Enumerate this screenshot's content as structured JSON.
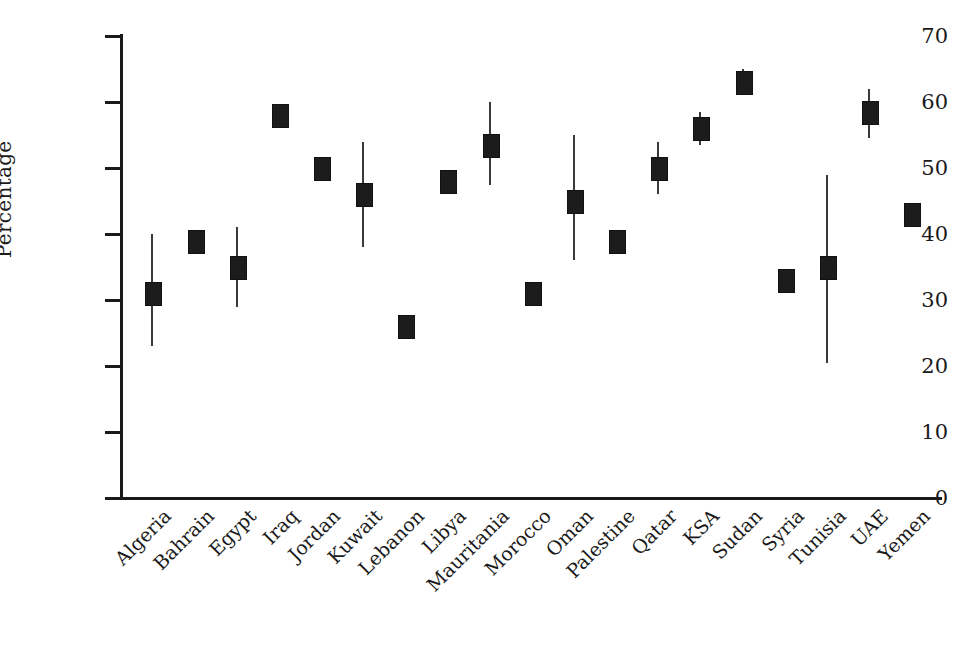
{
  "chart_data": {
    "type": "scatter",
    "title": "",
    "subtitle": "",
    "xlabel": "",
    "ylabel": "Percentage",
    "ylim": [
      0,
      70
    ],
    "yticks": [
      0,
      10,
      20,
      30,
      40,
      50,
      60,
      70
    ],
    "ytick_labels": [
      "0",
      "10",
      "20",
      "30",
      "40",
      "50",
      "60",
      "70"
    ],
    "grid": false,
    "legend": null,
    "marker_style": "filled-rectangle-with-vertical-error-bar",
    "categories": [
      "Algeria",
      "Bahrain",
      "Egypt",
      "Iraq",
      "Jordan",
      "Kuwait",
      "Lebanon",
      "Libya",
      "Mauritania",
      "Morocco",
      "Oman",
      "Palestine",
      "Qatar",
      "KSA",
      "Sudan",
      "Syria",
      "Tunisia",
      "UAE",
      "Yemen"
    ],
    "values": [
      31,
      39,
      35,
      58,
      50,
      46,
      26,
      48,
      53.5,
      31,
      45,
      39,
      50,
      56,
      63,
      33,
      35,
      58.5,
      43
    ],
    "ci_low": [
      23,
      37.5,
      29,
      56.5,
      48.5,
      38,
      25,
      46.5,
      47.5,
      29.5,
      36,
      37.5,
      46,
      53.5,
      61.5,
      32,
      20.5,
      54.5,
      41
    ],
    "ci_high": [
      40,
      40.5,
      41,
      59.5,
      51.5,
      54,
      27,
      49.5,
      60,
      32.5,
      55,
      40.5,
      54,
      58.5,
      65,
      34,
      49,
      62,
      44.5
    ],
    "points": [
      {
        "category": "Algeria",
        "value": 31,
        "ci_low": 23,
        "ci_high": 40
      },
      {
        "category": "Bahrain",
        "value": 39,
        "ci_low": 37.5,
        "ci_high": 40.5
      },
      {
        "category": "Egypt",
        "value": 35,
        "ci_low": 29,
        "ci_high": 41
      },
      {
        "category": "Iraq",
        "value": 58,
        "ci_low": 56.5,
        "ci_high": 59.5
      },
      {
        "category": "Jordan",
        "value": 50,
        "ci_low": 48.5,
        "ci_high": 51.5
      },
      {
        "category": "Kuwait",
        "value": 46,
        "ci_low": 38,
        "ci_high": 54
      },
      {
        "category": "Lebanon",
        "value": 26,
        "ci_low": 25,
        "ci_high": 27
      },
      {
        "category": "Libya",
        "value": 48,
        "ci_low": 46.5,
        "ci_high": 49.5
      },
      {
        "category": "Mauritania",
        "value": 53.5,
        "ci_low": 47.5,
        "ci_high": 60
      },
      {
        "category": "Morocco",
        "value": 31,
        "ci_low": 29.5,
        "ci_high": 32.5
      },
      {
        "category": "Oman",
        "value": 45,
        "ci_low": 36,
        "ci_high": 55
      },
      {
        "category": "Palestine",
        "value": 39,
        "ci_low": 37.5,
        "ci_high": 40.5
      },
      {
        "category": "Qatar",
        "value": 50,
        "ci_low": 46,
        "ci_high": 54
      },
      {
        "category": "KSA",
        "value": 56,
        "ci_low": 53.5,
        "ci_high": 58.5
      },
      {
        "category": "Sudan",
        "value": 63,
        "ci_low": 61.5,
        "ci_high": 65
      },
      {
        "category": "Syria",
        "value": 33,
        "ci_low": 32,
        "ci_high": 34
      },
      {
        "category": "Tunisia",
        "value": 35,
        "ci_low": 20.5,
        "ci_high": 49
      },
      {
        "category": "UAE",
        "value": 58.5,
        "ci_low": 54.5,
        "ci_high": 62
      },
      {
        "category": "Yemen",
        "value": 43,
        "ci_low": 41,
        "ci_high": 44.5
      }
    ]
  },
  "colors": {
    "marker": "#1c1c1c",
    "whisker": "#3a3a3a",
    "axis": "#1a1a1a",
    "background": "#ffffff"
  }
}
